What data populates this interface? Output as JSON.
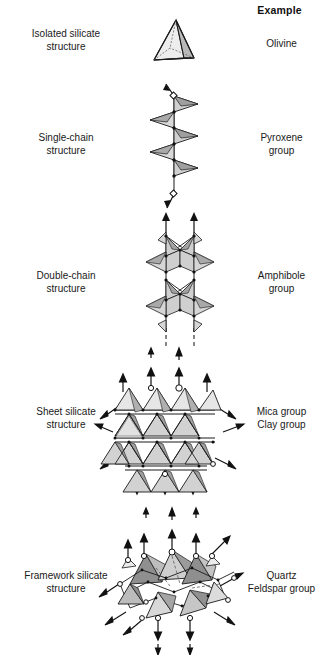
{
  "figure": {
    "column_header": "Example",
    "rows": [
      {
        "structure_label": "Isolated silicate\nstructure",
        "structure_line1": "Isolated silicate",
        "structure_line2": "structure",
        "example_line1": "Olivine",
        "example_line2": "",
        "diagram": "single-tetrahedron"
      },
      {
        "structure_label": "Single-chain\nstructure",
        "structure_line1": "Single-chain",
        "structure_line2": "structure",
        "example_line1": "Pyroxene",
        "example_line2": "group",
        "diagram": "single-chain"
      },
      {
        "structure_label": "Double-chain\nstructure",
        "structure_line1": "Double-chain",
        "structure_line2": "structure",
        "example_line1": "Amphibole",
        "example_line2": "group",
        "diagram": "double-chain"
      },
      {
        "structure_label": "Sheet silicate\nstructure",
        "structure_line1": "Sheet silicate",
        "structure_line2": "structure",
        "example_line1": "Mica group",
        "example_line2": "Clay group",
        "diagram": "sheet-silicate"
      },
      {
        "structure_label": "Framework silicate\nstructure",
        "structure_line1": "Framework silicate",
        "structure_line2": "structure",
        "example_line1": "Quartz",
        "example_line2": "Feldspar group",
        "diagram": "framework-silicate"
      }
    ]
  },
  "colors": {
    "ink": "#111111",
    "tetra_light": "#e8e8e8",
    "tetra_mid": "#c9c9c9",
    "tetra_dark": "#a6a6a6",
    "outline": "#1a1a1a",
    "background": "#ffffff"
  }
}
